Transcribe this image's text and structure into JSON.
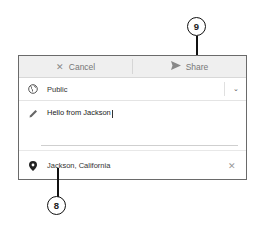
{
  "header": {
    "cancel_label": "Cancel",
    "share_label": "Share"
  },
  "visibility": {
    "label": "Public",
    "icon": "globe-icon"
  },
  "message": {
    "value": "Hello from Jackson",
    "icon": "pencil-icon"
  },
  "location": {
    "value": "Jackson, California",
    "icon": "map-pin-icon"
  },
  "callouts": [
    {
      "number": "9"
    },
    {
      "number": "8"
    }
  ]
}
